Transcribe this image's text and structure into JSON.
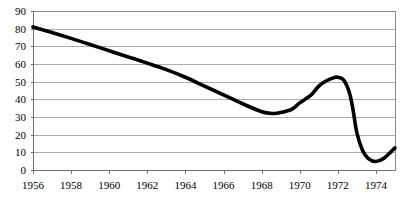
{
  "chart_data": {
    "type": "line",
    "title": "",
    "subtitle": "",
    "xlabel": "",
    "ylabel": "",
    "xlim": [
      1956,
      1975
    ],
    "ylim": [
      0,
      90
    ],
    "grid": true,
    "legend": false,
    "legend_position": "none",
    "y_ticks": [
      0,
      10,
      20,
      30,
      40,
      50,
      60,
      70,
      80,
      90
    ],
    "y_tick_labels": [
      "0",
      "10",
      "20",
      "30",
      "40",
      "50",
      "60",
      "70",
      "80",
      "90"
    ],
    "x_ticks": [
      1956,
      1958,
      1960,
      1962,
      1964,
      1966,
      1968,
      1970,
      1972,
      1974
    ],
    "x_tick_labels": [
      "1956",
      "1958",
      "1960",
      "1962",
      "1964",
      "1966",
      "1968",
      "1970",
      "1972",
      "1974"
    ],
    "series": [
      {
        "name": "series-1",
        "color": "#000000",
        "x": [
          1956,
          1957,
          1958,
          1959,
          1960,
          1961,
          1962,
          1963,
          1964,
          1965,
          1966,
          1967,
          1968,
          1968.6,
          1969,
          1969.6,
          1970,
          1970.6,
          1971,
          1971.4,
          1971.8,
          1972,
          1972.3,
          1972.6,
          1972.8,
          1973,
          1973.3,
          1973.6,
          1974,
          1974.4,
          1975
        ],
        "values": [
          81,
          77.8,
          74.5,
          71,
          67.5,
          64,
          60.5,
          56.8,
          52.5,
          47.5,
          42.5,
          37.5,
          33,
          32,
          32.5,
          34.5,
          38,
          42.5,
          47.5,
          50.5,
          52.3,
          52.5,
          51,
          44,
          34,
          21,
          11,
          6.5,
          4.8,
          6.5,
          12.5
        ]
      }
    ],
    "annotations": []
  },
  "plot_geometry": {
    "left": 33,
    "right": 395,
    "top": 11,
    "bottom": 170
  },
  "colors": {
    "series": "#000000",
    "grid": "#9a9a9a",
    "axis": "#6e6e6e",
    "background": "#ffffff",
    "text": "#000000"
  }
}
